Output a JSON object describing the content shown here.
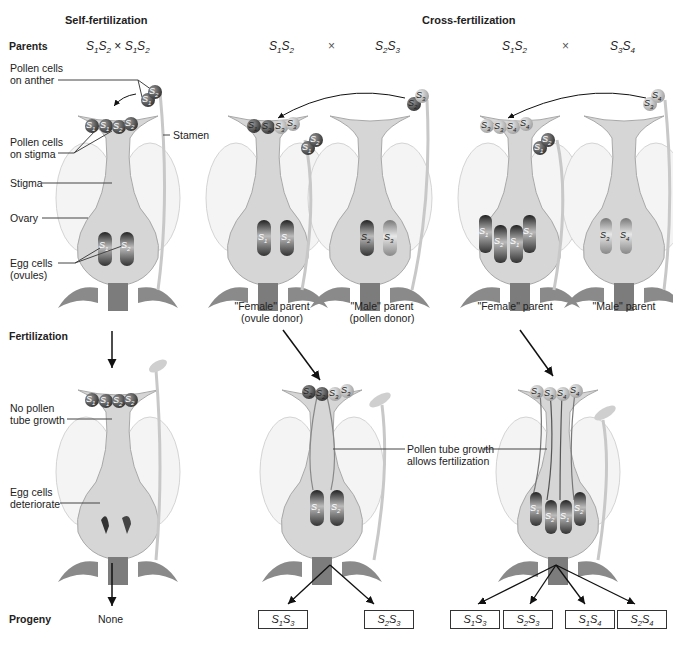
{
  "headers": {
    "self": "Self-fertilization",
    "cross": "Cross-fertilization"
  },
  "row_labels": {
    "parents": "Parents",
    "fertilization": "Fertilization",
    "progeny": "Progeny"
  },
  "self_panel": {
    "cross_notation": {
      "a": "S",
      "a1": "1",
      "b": "S",
      "b1": "2",
      "x": "×",
      "c": "S",
      "c1": "1",
      "d": "S",
      "d1": "2"
    },
    "labels": {
      "pollen_on_anther_1": "Pollen cells",
      "pollen_on_anther_2": "on anther",
      "pollen_on_stigma_1": "Pollen cells",
      "pollen_on_stigma_2": "on stigma",
      "stamen": "Stamen",
      "stigma": "Stigma",
      "ovary": "Ovary",
      "egg_cells_1": "Egg cells",
      "egg_cells_2": "(ovules)",
      "no_tube_1": "No pollen",
      "no_tube_2": "tube growth",
      "deteriorate_1": "Egg cells",
      "deteriorate_2": "deteriorate"
    },
    "anther_pollen": [
      "S1",
      "S2"
    ],
    "stigma_pollen": [
      "S1",
      "S1",
      "S2",
      "S2"
    ],
    "ovules": [
      "S1",
      "S2"
    ],
    "fert_pollen": [
      "S1",
      "S1",
      "S2",
      "S2"
    ],
    "progeny": "None"
  },
  "cross_panel_1": {
    "female": {
      "g1": "S",
      "s1": "1",
      "g2": "S",
      "s2": "2"
    },
    "times": "×",
    "male": {
      "g1": "S",
      "s1": "2",
      "g2": "S",
      "s2": "3"
    },
    "female_caption_1": "\"Female\" parent",
    "female_caption_2": "(ovule donor)",
    "male_caption_1": "\"Male\" parent",
    "male_caption_2": "(pollen donor)",
    "female_stigma_pollen": [
      "S1",
      "S2",
      "S3",
      "S3"
    ],
    "female_anther_pollen": [
      "S1",
      "S2"
    ],
    "male_anther_pollen": [
      "S2",
      "S3"
    ],
    "female_ovules": [
      "S1",
      "S2"
    ],
    "male_ovules": [
      "S2",
      "S3"
    ],
    "fert_pollen": [
      "S2",
      "S2",
      "S3",
      "S3"
    ],
    "fert_ovules": [
      "S1",
      "S2"
    ],
    "tube_label_1": "Pollen tube growth",
    "tube_label_2": "allows fertilization",
    "progeny": [
      {
        "a": "S",
        "a1": "1",
        "b": "S",
        "b1": "3"
      },
      {
        "a": "S",
        "a1": "2",
        "b": "S",
        "b1": "3"
      }
    ]
  },
  "cross_panel_2": {
    "female": {
      "g1": "S",
      "s1": "1",
      "g2": "S",
      "s2": "2"
    },
    "times": "×",
    "male": {
      "g1": "S",
      "s1": "3",
      "g2": "S",
      "s2": "4"
    },
    "female_caption": "\"Female\" parent",
    "male_caption": "\"Male\" parent",
    "female_stigma_pollen": [
      "S3",
      "S3",
      "S4",
      "S4"
    ],
    "female_anther_pollen": [
      "S1",
      "S2"
    ],
    "male_anther_pollen": [
      "S3",
      "S4"
    ],
    "female_ovules": [
      "S1",
      "S2",
      "S1",
      "S2"
    ],
    "male_ovules": [
      "S3",
      "S4"
    ],
    "fert_pollen": [
      "S3",
      "S3",
      "S4",
      "S4"
    ],
    "fert_ovules": [
      "S1",
      "S2",
      "S1",
      "S2"
    ],
    "progeny": [
      {
        "a": "S",
        "a1": "1",
        "b": "S",
        "b1": "3"
      },
      {
        "a": "S",
        "a1": "2",
        "b": "S",
        "b1": "3"
      },
      {
        "a": "S",
        "a1": "1",
        "b": "S",
        "b1": "4"
      },
      {
        "a": "S",
        "a1": "2",
        "b": "S",
        "b1": "4"
      }
    ]
  },
  "colors": {
    "flower_fill": "#d9d9d9",
    "flower_edge": "#a8a8a8",
    "petal": "#eeeeee",
    "sepal": "#8c8c8c",
    "pollen_dark": "#5a5a5a",
    "pollen_light": "#c8c8c8",
    "ovule_dark": "#4a4a4a",
    "text": "#222222"
  }
}
